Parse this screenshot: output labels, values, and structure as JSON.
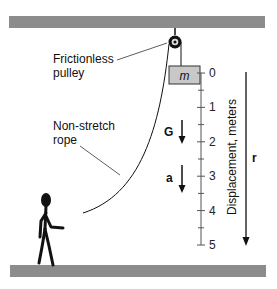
{
  "labels": {
    "pulley_line1": "Frictionless",
    "pulley_line2": "pulley",
    "rope_line1": "Non-stretch",
    "rope_line2": "rope",
    "mass": "m",
    "gravity": "G",
    "acceleration": "a",
    "axis_title": "Displacement, meters",
    "displacement_vector": "r"
  },
  "scale": {
    "ticks": [
      "0",
      "1",
      "2",
      "3",
      "4",
      "5"
    ]
  },
  "colors": {
    "bar": "#8c8c8c",
    "mass_fill": "#c8c8c8",
    "ink": "#111111"
  }
}
